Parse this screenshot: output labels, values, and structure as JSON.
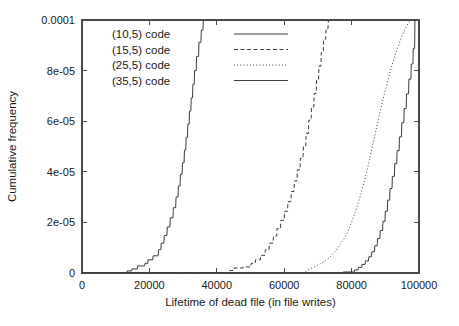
{
  "chart_data": {
    "type": "line",
    "title": "",
    "xlabel": "Lifetime of dead file (in file writes)",
    "ylabel": "Cumulative frequency",
    "xlim": [
      0,
      100000
    ],
    "ylim": [
      0,
      0.0001
    ],
    "grid": false,
    "legend_position": "top-left",
    "xticks": [
      0,
      20000,
      40000,
      60000,
      80000,
      100000
    ],
    "xticklabels": [
      "0",
      "20000",
      "40000",
      "60000",
      "80000",
      "100000"
    ],
    "yticks": [
      0,
      2e-05,
      4e-05,
      6e-05,
      8e-05,
      0.0001
    ],
    "yticklabels": [
      "0",
      "2e-05",
      "4e-05",
      "6e-05",
      "8e-05",
      "0.0001"
    ],
    "series": [
      {
        "name": "(10,5) code",
        "style": "solid",
        "color": "#3c3c3c",
        "x": [
          0,
          13300,
          13400,
          14700,
          14800,
          16400,
          16500,
          18600,
          18700,
          19500,
          19600,
          21000,
          21100,
          22600,
          22700,
          23400,
          23500,
          24300,
          24400,
          25200,
          25300,
          26100,
          26200,
          27000,
          27100,
          27800,
          27900,
          28500,
          28600,
          29100,
          29200,
          29700,
          29800,
          30300,
          30400,
          30800,
          30900,
          31300,
          31400,
          31800,
          31900,
          32300,
          32400,
          32800,
          32900,
          33300,
          33400,
          33900,
          34000,
          34600,
          34700,
          35300,
          35400,
          35900,
          36000,
          36100
        ],
        "y": [
          0,
          0,
          8e-07,
          8e-07,
          1.6e-06,
          1.6e-06,
          2.8e-06,
          2.8e-06,
          3.8e-06,
          3.8e-06,
          5.2e-06,
          5.2e-06,
          6.8e-06,
          6.8e-06,
          9.2e-06,
          9.2e-06,
          1.18e-05,
          1.18e-05,
          1.48e-05,
          1.48e-05,
          1.82e-05,
          1.82e-05,
          2.18e-05,
          2.18e-05,
          2.58e-05,
          2.58e-05,
          3e-05,
          3e-05,
          3.44e-05,
          3.44e-05,
          3.9e-05,
          3.9e-05,
          4.36e-05,
          4.36e-05,
          4.86e-05,
          4.86e-05,
          5.36e-05,
          5.36e-05,
          5.88e-05,
          5.88e-05,
          6.4e-05,
          6.4e-05,
          6.92e-05,
          6.92e-05,
          7.46e-05,
          7.46e-05,
          8e-05,
          8e-05,
          8.56e-05,
          8.56e-05,
          9.12e-05,
          9.12e-05,
          9.6e-05,
          9.6e-05,
          0.0001,
          0.0001
        ]
      },
      {
        "name": "(15,5) code",
        "style": "dashed",
        "color": "#3c3c3c",
        "x": [
          0,
          43600,
          43700,
          45200,
          45300,
          47800,
          47900,
          50100,
          50200,
          51400,
          51500,
          52900,
          53000,
          54300,
          54400,
          55500,
          55600,
          56700,
          56800,
          57800,
          57900,
          58900,
          59000,
          60000,
          60100,
          61000,
          61100,
          62000,
          62100,
          62900,
          63000,
          63800,
          63900,
          64700,
          64800,
          65600,
          65700,
          66400,
          66500,
          67200,
          67300,
          68000,
          68100,
          68800,
          68900,
          69500,
          69600,
          70200,
          70300,
          70900,
          71000,
          71600,
          71700,
          72300,
          72400,
          73000,
          73100,
          73300
        ],
        "y": [
          0,
          0,
          1e-06,
          1e-06,
          2e-06,
          2e-06,
          2.4e-06,
          2.4e-06,
          3.8e-06,
          3.8e-06,
          5.2e-06,
          5.2e-06,
          7e-06,
          7e-06,
          9.2e-06,
          9.2e-06,
          1.18e-05,
          1.18e-05,
          1.46e-05,
          1.46e-05,
          1.76e-05,
          1.76e-05,
          2.08e-05,
          2.08e-05,
          2.44e-05,
          2.44e-05,
          2.82e-05,
          2.82e-05,
          3.22e-05,
          3.22e-05,
          3.64e-05,
          3.64e-05,
          4.08e-05,
          4.08e-05,
          4.54e-05,
          4.54e-05,
          5.02e-05,
          5.02e-05,
          5.52e-05,
          5.52e-05,
          6.04e-05,
          6.04e-05,
          6.56e-05,
          6.56e-05,
          7.1e-05,
          7.1e-05,
          7.64e-05,
          7.64e-05,
          8.18e-05,
          8.18e-05,
          8.72e-05,
          8.72e-05,
          9.24e-05,
          9.24e-05,
          9.66e-05,
          9.66e-05,
          0.0001,
          0.0001
        ]
      },
      {
        "name": "(25,5) code",
        "style": "dotted",
        "color": "#3c3c3c",
        "x": [
          0,
          65800,
          66400,
          67200,
          68000,
          68900,
          69800,
          70700,
          71600,
          72400,
          73200,
          74000,
          74800,
          75600,
          76400,
          77200,
          78000,
          78800,
          79500,
          80200,
          80900,
          81600,
          82300,
          83000,
          83700,
          84400,
          85000,
          85600,
          86200,
          86800,
          87400,
          88000,
          88600,
          89200,
          89800,
          90400,
          91000,
          91600,
          92200,
          92800,
          93400,
          94000,
          94600,
          95200,
          95800,
          96400,
          96900,
          97300,
          97600,
          97800
        ],
        "y": [
          0,
          0,
          6e-07,
          1.2e-06,
          1.8e-06,
          2.4e-06,
          3e-06,
          3.6e-06,
          4.2e-06,
          5e-06,
          5.8e-06,
          6.8e-06,
          8e-06,
          9.4e-06,
          1.08e-05,
          1.24e-05,
          1.42e-05,
          1.62e-05,
          1.84e-05,
          2.08e-05,
          2.34e-05,
          2.62e-05,
          2.92e-05,
          3.24e-05,
          3.58e-05,
          3.94e-05,
          4.3e-05,
          4.66e-05,
          5.02e-05,
          5.38e-05,
          5.74e-05,
          6.1e-05,
          6.46e-05,
          6.8e-05,
          7.12e-05,
          7.42e-05,
          7.72e-05,
          8.02e-05,
          8.3e-05,
          8.56e-05,
          8.8e-05,
          9.02e-05,
          9.24e-05,
          9.44e-05,
          9.62e-05,
          9.78e-05,
          9.9e-05,
          9.96e-05,
          0.0001,
          0.0001
        ]
      },
      {
        "name": "(35,5) code",
        "style": "solid",
        "color": "#3c3c3c",
        "x": [
          0,
          77400,
          77500,
          80800,
          80900,
          81900,
          82000,
          83000,
          83100,
          84000,
          84100,
          85000,
          85100,
          85900,
          86000,
          86800,
          86900,
          87600,
          87700,
          88400,
          88500,
          89200,
          89300,
          89900,
          90000,
          90600,
          90700,
          91300,
          91400,
          92000,
          92100,
          92700,
          92800,
          93400,
          93500,
          94100,
          94200,
          94800,
          94900,
          95500,
          95600,
          96200,
          96300,
          96900,
          97000,
          97600,
          97700,
          98200,
          98300,
          98700,
          98800,
          99000
        ],
        "y": [
          0,
          0,
          4e-07,
          4e-07,
          1.2e-06,
          1.2e-06,
          2.2e-06,
          2.2e-06,
          3.4e-06,
          3.4e-06,
          4.8e-06,
          4.8e-06,
          6.4e-06,
          6.4e-06,
          8.4e-06,
          8.4e-06,
          1.08e-05,
          1.08e-05,
          1.36e-05,
          1.36e-05,
          1.68e-05,
          1.68e-05,
          2.04e-05,
          2.04e-05,
          2.44e-05,
          2.44e-05,
          2.88e-05,
          2.88e-05,
          3.34e-05,
          3.34e-05,
          3.82e-05,
          3.82e-05,
          4.32e-05,
          4.32e-05,
          4.84e-05,
          4.84e-05,
          5.38e-05,
          5.38e-05,
          5.94e-05,
          5.94e-05,
          6.5e-05,
          6.5e-05,
          7.08e-05,
          7.08e-05,
          7.66e-05,
          7.66e-05,
          8.26e-05,
          8.26e-05,
          8.88e-05,
          8.88e-05,
          0.0001,
          0.0001
        ]
      }
    ]
  },
  "legend": {
    "entries": [
      {
        "label": "(10,5) code",
        "style": "solid"
      },
      {
        "label": "(15,5) code",
        "style": "dashed"
      },
      {
        "label": "(25,5) code",
        "style": "dotted"
      },
      {
        "label": "(35,5) code",
        "style": "solid"
      }
    ]
  },
  "colors": {
    "axis": "#4a4a4a",
    "text": "#1a1a1a",
    "line": "#3c3c3c",
    "background": "#ffffff"
  }
}
